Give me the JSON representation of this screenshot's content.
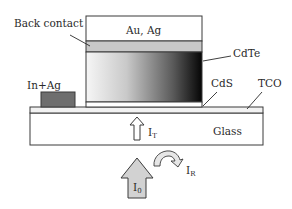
{
  "diagram": {
    "layers": [
      {
        "id": "au_ag",
        "label": "Au, Ag"
      },
      {
        "id": "back_contact",
        "label": "Back contact"
      },
      {
        "id": "cdte",
        "label": "CdTe"
      },
      {
        "id": "cds",
        "label": "CdS"
      },
      {
        "id": "tco",
        "label": "TCO"
      },
      {
        "id": "glass",
        "label": "Glass"
      },
      {
        "id": "in_ag",
        "label": "In+Ag"
      }
    ],
    "light": {
      "incident": {
        "main": "I",
        "sub": "0"
      },
      "reflected": {
        "main": "I",
        "sub": "R"
      },
      "transmitted": {
        "main": "I",
        "sub": "T"
      }
    },
    "colors": {
      "outline": "#3a3a3a",
      "back_contact_fill": "#c8c8c8",
      "in_ag_fill": "#6e6e6e",
      "cdte_gradient_start": "#f4f4f4",
      "cdte_gradient_end": "#0a0a0a",
      "arrow_fill": "#d2d2d2"
    }
  }
}
